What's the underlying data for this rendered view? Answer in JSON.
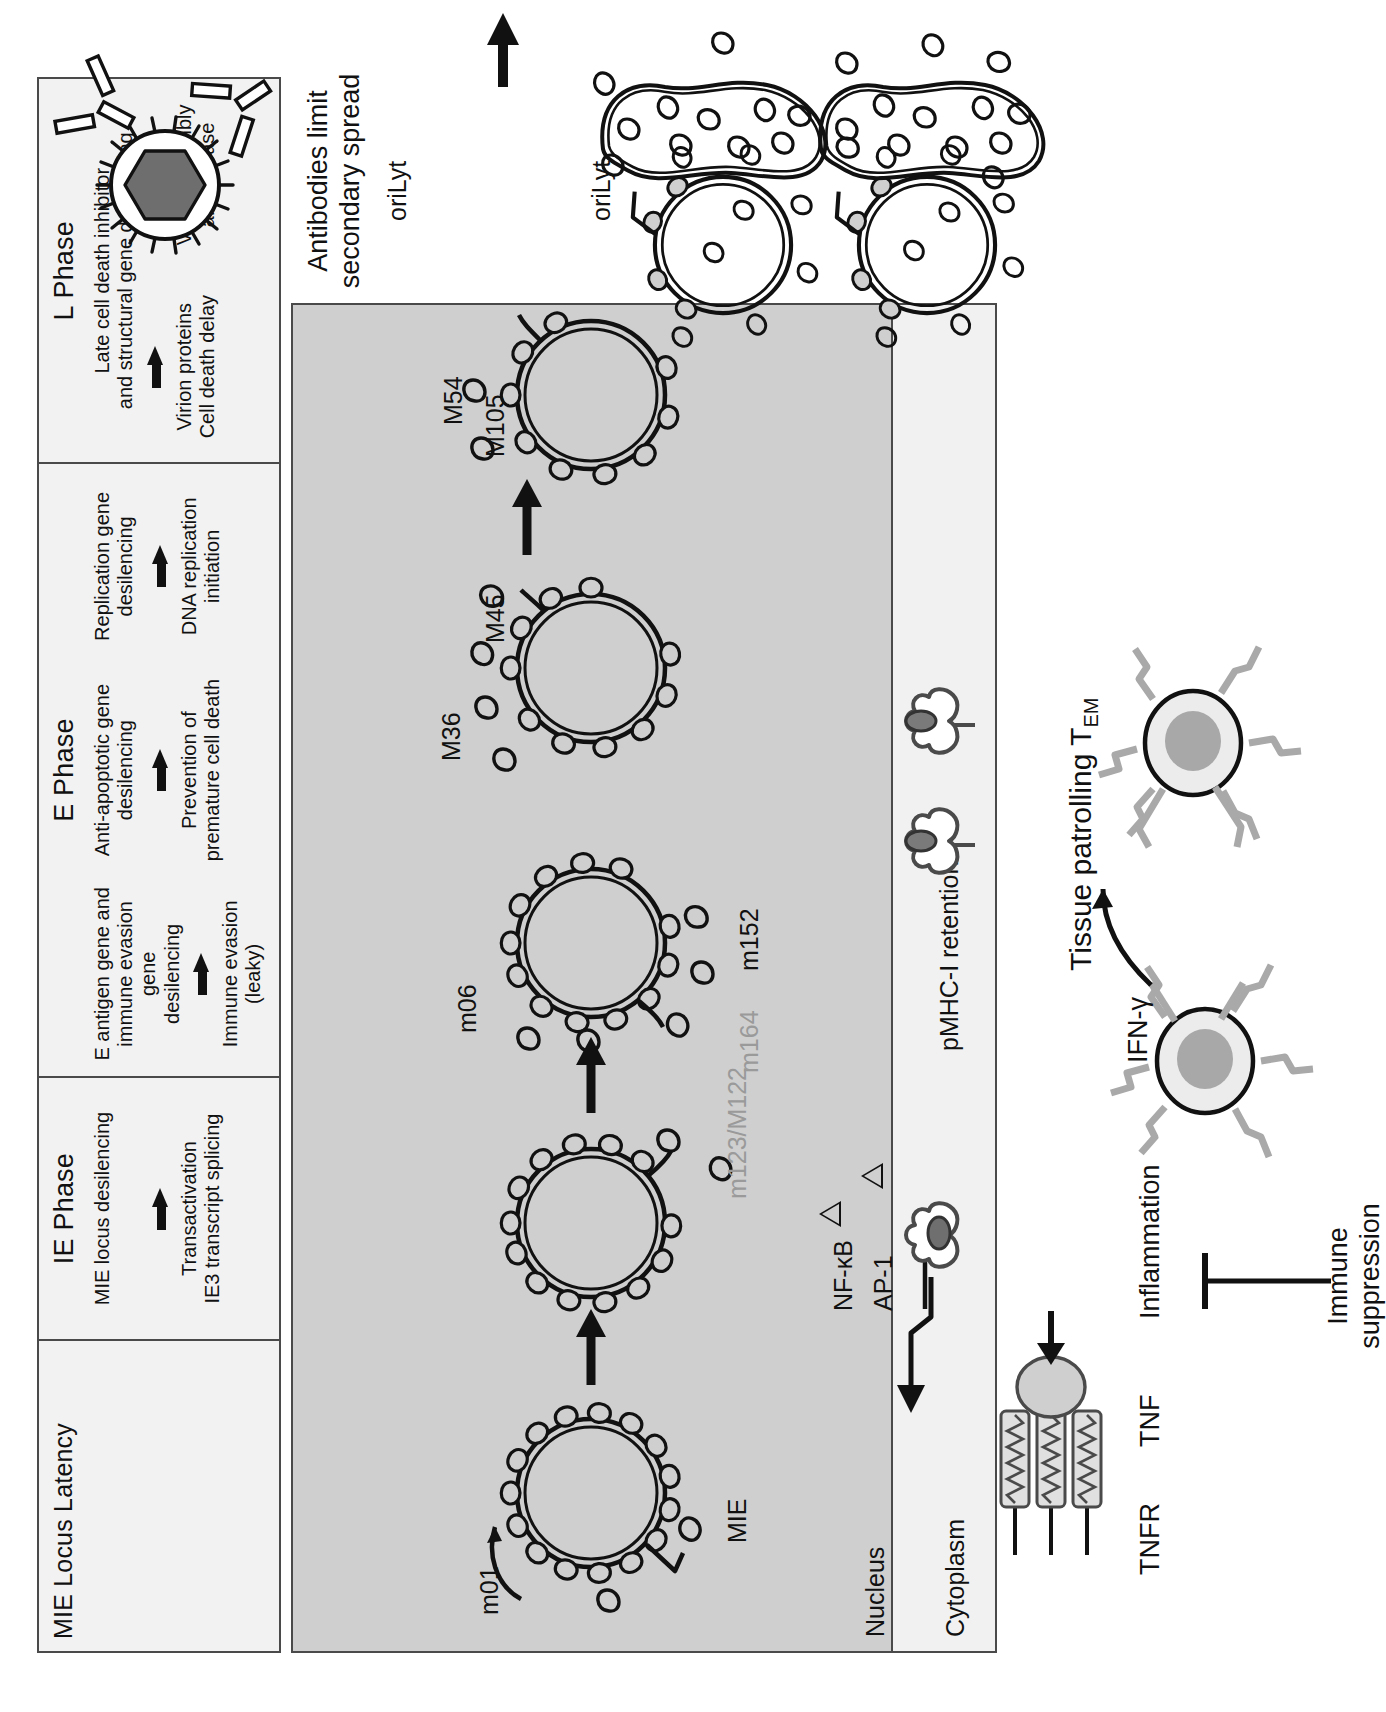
{
  "figure": {
    "orientation": "rotated-90-ccw",
    "colors": {
      "nucleus_fill": "#cfcfcf",
      "cytoplasm_fill": "#f1f1f1",
      "panel_fill": "#f2f2f2",
      "panel_border": "#4a4a4a",
      "ink": "#111111",
      "grey_gene_label": "#9a9a9a",
      "capsid_fill": "#6e6e6e",
      "tnf_fill": "#cccccc",
      "tcell_cytosol": "#e4e4e4",
      "tcell_nucleus": "#a8a8a8",
      "tcr_grey": "#9e9e9e"
    }
  },
  "phase_table": {
    "columns": [
      {
        "title": "MIE Locus Latency",
        "title_align": "left",
        "subcolumns": [
          {
            "top": "",
            "arrow": false,
            "bottom": ""
          }
        ]
      },
      {
        "title": "IE Phase",
        "title_align": "center",
        "subcolumns": [
          {
            "top": "MIE locus desilencing",
            "arrow": true,
            "bottom": "Transactivation\nIE3 transcript splicing"
          }
        ]
      },
      {
        "title": "E Phase",
        "title_align": "center",
        "subcolumns": [
          {
            "top": "E antigen gene and\nimmune evasion gene\ndesilencing",
            "arrow": true,
            "bottom": "Immune evasion\n(leaky)"
          },
          {
            "top": "Anti-apoptotic gene\ndesilencing",
            "arrow": true,
            "bottom": "Prevention of\npremature cell death"
          },
          {
            "top": "Replication gene\ndesilencing",
            "arrow": true,
            "bottom": "DNA replication\ninitiation"
          }
        ]
      },
      {
        "title": "L Phase",
        "title_align": "center",
        "subcolumns": [
          {
            "top": "Late cell death inhibitor\nand structural gene desilencing",
            "arrow": true,
            "bottom": "Virion proteins\nCell death delay"
          },
          {
            "top": "",
            "arrow": true,
            "bottom": "Virion assembly\nand release"
          }
        ]
      }
    ]
  },
  "cell": {
    "nucleus_label": "Nucleus",
    "cytoplasm_label": "Cytoplasm",
    "pmhc_label": "pMHC-I retention",
    "genome_labels": {
      "mie": "MIE",
      "m01": "m01",
      "m123_M122": "m123/M122",
      "nfkb": "NF-κB",
      "ap1": "AP-1",
      "m164": "m164",
      "m152": "m152",
      "m06": "m06",
      "M36": "M36",
      "M45": "M45",
      "M54": "M54",
      "M105": "M105",
      "oriLyt_1": "oriLyt",
      "oriLyt_2": "oriLyt"
    }
  },
  "extracellular": {
    "tnfr_label": "TNFR",
    "tnf_label": "TNF",
    "inflammation_label": "Inflammation",
    "immune_suppression_label": "Immune\nsuppression",
    "ifng_label": "IFN-γ",
    "tissue_patrolling_label": "Tissue patrolling T",
    "tissue_patrolling_sub": "EM",
    "antibodies_label": "Antibodies limit\nsecondary spread"
  }
}
